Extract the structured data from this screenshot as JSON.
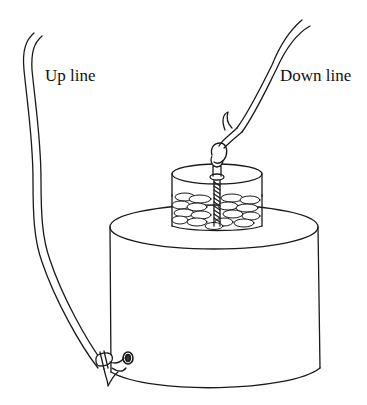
{
  "diagram": {
    "labels": {
      "up_line": "Up line",
      "down_line": "Down line"
    },
    "colors": {
      "stroke": "#1a1a1a",
      "background": "#ffffff"
    }
  }
}
